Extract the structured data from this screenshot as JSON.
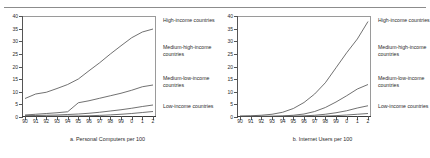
{
  "figure": {
    "panels": [
      {
        "id": "a",
        "caption": "a. Personal Computers per 100",
        "legend": [
          "High-income countries",
          "Medium-high-income countries",
          "Medium-low-income countries",
          "Low-income countries"
        ]
      },
      {
        "id": "b",
        "caption": "b. Internet Users per 100",
        "legend": [
          "High-income countries",
          "Medium-high-income countries",
          "Medium-low-income countries",
          "Low-income countries"
        ]
      }
    ]
  },
  "chart_data": [
    {
      "type": "line",
      "title": "a. Personal Computers per 100",
      "xlabel": "",
      "ylabel": "",
      "x": [
        "90",
        "91",
        "92",
        "93",
        "94",
        "95",
        "96",
        "97",
        "98",
        "99",
        "0",
        "1",
        "2"
      ],
      "ylim": [
        0,
        40
      ],
      "yticks": [
        0,
        5,
        10,
        15,
        20,
        25,
        30,
        35,
        40
      ],
      "grid": false,
      "legend_position": "right",
      "series": [
        {
          "name": "High-income countries",
          "values": [
            7.2,
            9.0,
            9.7,
            11.2,
            12.8,
            15.0,
            18.3,
            21.5,
            25.0,
            28.3,
            31.5,
            33.8,
            35.0
          ]
        },
        {
          "name": "Medium-high-income countries",
          "values": [
            0.6,
            0.9,
            1.2,
            1.5,
            1.9,
            5.5,
            6.3,
            7.3,
            8.3,
            9.3,
            10.5,
            11.9,
            12.6
          ]
        },
        {
          "name": "Medium-low-income countries",
          "values": [
            0.3,
            0.4,
            0.5,
            0.6,
            0.8,
            1.0,
            1.3,
            1.7,
            2.2,
            2.7,
            3.3,
            4.0,
            4.6
          ]
        },
        {
          "name": "Low-income countries",
          "values": [
            0.05,
            0.07,
            0.09,
            0.12,
            0.16,
            0.22,
            0.3,
            0.45,
            0.65,
            0.9,
            1.2,
            1.6,
            2.0
          ]
        }
      ]
    },
    {
      "type": "line",
      "title": "b. Internet Users per 100",
      "xlabel": "",
      "ylabel": "",
      "x": [
        "90",
        "91",
        "92",
        "93",
        "94",
        "95",
        "96",
        "97",
        "98",
        "99",
        "0",
        "1",
        "2"
      ],
      "ylim": [
        0,
        40
      ],
      "yticks": [
        0,
        5,
        10,
        15,
        20,
        25,
        30,
        35,
        40
      ],
      "grid": false,
      "legend_position": "right",
      "series": [
        {
          "name": "High-income countries",
          "values": [
            0.2,
            0.3,
            0.5,
            0.9,
            1.7,
            3.2,
            5.6,
            9.0,
            13.5,
            19.5,
            25.5,
            31.0,
            38.0
          ]
        },
        {
          "name": "Medium-high-income countries",
          "values": [
            0.02,
            0.04,
            0.07,
            0.12,
            0.25,
            0.5,
            1.0,
            2.0,
            3.6,
            5.8,
            8.3,
            11.0,
            12.8
          ]
        },
        {
          "name": "Medium-low-income countries",
          "values": [
            0.01,
            0.01,
            0.02,
            0.04,
            0.07,
            0.12,
            0.25,
            0.5,
            0.9,
            1.5,
            2.3,
            3.4,
            4.3
          ]
        },
        {
          "name": "Low-income countries",
          "values": [
            0.0,
            0.0,
            0.01,
            0.01,
            0.02,
            0.03,
            0.06,
            0.1,
            0.2,
            0.35,
            0.6,
            0.9,
            1.2
          ]
        }
      ]
    }
  ],
  "style": {
    "line_color": "#4d4d4d",
    "axis_color": "#555555",
    "text_color": "#2b2b2b",
    "background": "#ffffff"
  }
}
